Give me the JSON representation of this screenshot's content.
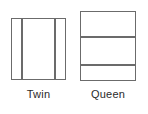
{
  "diagram": {
    "type": "bed-size-comparison",
    "background_color": "#ffffff",
    "stroke_color": "#6b6b6b",
    "text_color": "#2b2b2b",
    "items": [
      {
        "id": "twin",
        "label": "Twin",
        "shape": "rectangle",
        "division_axis": "vertical",
        "panel_count": 3,
        "divider_count": 2,
        "width_px": 55,
        "height_px": 62
      },
      {
        "id": "queen",
        "label": "Queen",
        "shape": "rectangle",
        "division_axis": "horizontal",
        "panel_count": 3,
        "divider_count": 2,
        "width_px": 56,
        "height_px": 70
      }
    ]
  }
}
